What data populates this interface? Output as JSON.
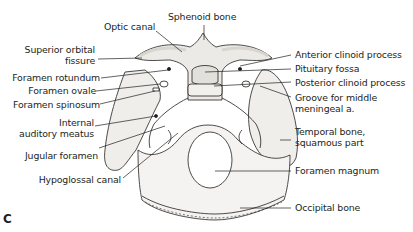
{
  "figure": {
    "panel_letter": "C",
    "colors": {
      "line": "#231f20",
      "bone_shade": "#e9e7e3",
      "background": "#ffffff"
    }
  },
  "labels": {
    "left": [
      {
        "id": "superior-orbital-fissure",
        "lines": [
          "Superior orbital",
          "fissure"
        ]
      },
      {
        "id": "foramen-rotundum",
        "lines": [
          "Foramen rotundum"
        ]
      },
      {
        "id": "foramen-ovale",
        "lines": [
          "Foramen ovale"
        ]
      },
      {
        "id": "foramen-spinosum",
        "lines": [
          "Foramen spinosum"
        ]
      },
      {
        "id": "internal-auditory-meatus",
        "lines": [
          "Internal",
          "auditory meatus"
        ]
      },
      {
        "id": "jugular-foramen",
        "lines": [
          "Jugular foramen"
        ]
      },
      {
        "id": "hypoglossal-canal",
        "lines": [
          "Hypoglossal canal"
        ]
      }
    ],
    "top": [
      {
        "id": "optic-canal",
        "lines": [
          "Optic canal"
        ]
      },
      {
        "id": "sphenoid-bone",
        "lines": [
          "Sphenoid bone"
        ]
      }
    ],
    "right": [
      {
        "id": "anterior-clinoid-process",
        "lines": [
          "Anterior clinoid process"
        ]
      },
      {
        "id": "pituitary-fossa",
        "lines": [
          "Pituitary fossa"
        ]
      },
      {
        "id": "posterior-clinoid-process",
        "lines": [
          "Posterior clinoid process"
        ]
      },
      {
        "id": "groove-middle-meningeal",
        "lines": [
          "Groove for middle",
          "meningeal a."
        ]
      },
      {
        "id": "temporal-bone-squamous",
        "lines": [
          "Temporal bone,",
          "squamous part"
        ]
      },
      {
        "id": "foramen-magnum",
        "lines": [
          "Foramen magnum"
        ]
      },
      {
        "id": "occipital-bone",
        "lines": [
          "Occipital bone"
        ]
      }
    ]
  }
}
